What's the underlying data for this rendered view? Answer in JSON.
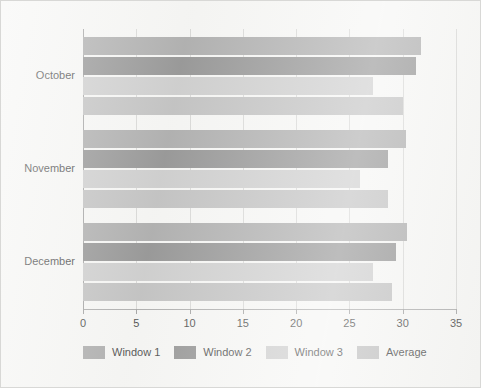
{
  "chart_data": {
    "type": "bar",
    "orientation": "horizontal",
    "title": "",
    "xlabel": "",
    "ylabel": "",
    "categories": [
      "October",
      "November",
      "December"
    ],
    "series": [
      {
        "name": "Window 1",
        "color": "#9a9a9a",
        "values": [
          31.7,
          30.3,
          30.4
        ]
      },
      {
        "name": "Window 2",
        "color": "#7b7b7b",
        "values": [
          31.2,
          28.6,
          29.4
        ]
      },
      {
        "name": "Window 3",
        "color": "#c2c2c2",
        "values": [
          27.2,
          26.0,
          27.2
        ]
      },
      {
        "name": "Average",
        "color": "#b3b3b3",
        "values": [
          30.0,
          28.6,
          29.0
        ]
      }
    ],
    "xlim": [
      0,
      35
    ],
    "xticks": [
      0,
      5,
      10,
      15,
      20,
      25,
      30,
      35
    ],
    "xtick_labels": [
      "0",
      "5",
      "10",
      "15",
      "20",
      "25",
      "30",
      "35"
    ],
    "grid": true,
    "grid_axis": "x",
    "legend_position": "bottom"
  },
  "legend": {
    "items": [
      {
        "label": "Window 1",
        "color": "#9a9a9a"
      },
      {
        "label": "Window 2",
        "color": "#7b7b7b"
      },
      {
        "label": "Window 3",
        "color": "#c2c2c2"
      },
      {
        "label": "Average",
        "color": "#b3b3b3"
      }
    ]
  },
  "style": {
    "background": "#f4f4f2",
    "border_color": "#d8d8d6",
    "axis_color": "#8e8e8e",
    "grid_color": "#cfcfcd",
    "text_color": "#1c1c1c"
  }
}
